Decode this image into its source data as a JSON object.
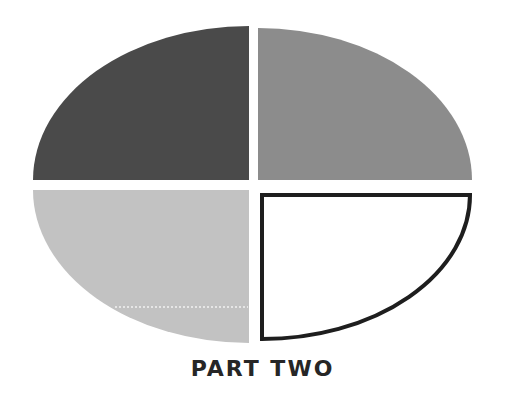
{
  "caption": "PART TWO",
  "colors": {
    "background": "#ffffff",
    "top_left": "#4a4a4a",
    "top_right": "#8c8c8c",
    "bottom_left": "#c2c2c2",
    "bottom_right_fill": "#ffffff",
    "bottom_right_stroke": "#1e1e1e"
  },
  "quadrants": [
    {
      "position": "top-left",
      "fill": "dark-gray"
    },
    {
      "position": "top-right",
      "fill": "medium-gray"
    },
    {
      "position": "bottom-left",
      "fill": "light-gray"
    },
    {
      "position": "bottom-right",
      "fill": "white-outlined"
    }
  ]
}
